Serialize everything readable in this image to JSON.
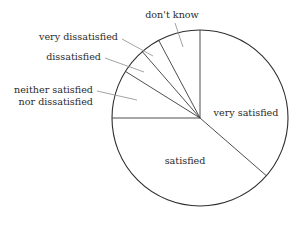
{
  "chart_data": {
    "type": "pie",
    "title": "",
    "subtitle": "",
    "xlabel": "",
    "ylabel": "",
    "legend_position": "none",
    "grid": false,
    "labels_placement": "callout-and-inside",
    "center": {
      "x": 200,
      "y": 118
    },
    "radius": 88,
    "start_angle_deg": 90,
    "direction": "clockwise",
    "categories": [
      "very satisfied",
      "satisfied",
      "neither satisfied nor dissatisfied",
      "dissatisfied",
      "very dissatisfied",
      "don't know"
    ],
    "values": [
      36,
      41,
      9,
      5,
      4,
      5
    ],
    "units": "percent",
    "slices": [
      {
        "label": "very satisfied",
        "value": 36,
        "start_deg": 90,
        "end_deg": -41,
        "sweep_deg": 131,
        "label_x": 246,
        "label_y": 113,
        "label_anchor": "middle",
        "callout": false
      },
      {
        "label": "satisfied",
        "value": 41,
        "start_deg": -41,
        "end_deg": -180,
        "sweep_deg": 139,
        "label_x": 185,
        "label_y": 161,
        "label_anchor": "middle",
        "callout": false
      },
      {
        "label": "neither satisfied",
        "label_line2": "nor dissatisfied",
        "value": 9,
        "start_deg": 180,
        "end_deg": 148,
        "sweep_deg": 32,
        "label_x": 93,
        "label_y": 90,
        "label_anchor": "end",
        "callout": true,
        "leader": {
          "x1": 97,
          "y1": 91,
          "x2": 137,
          "y2": 100
        }
      },
      {
        "label": "dissatisfied",
        "value": 5,
        "start_deg": 148,
        "end_deg": 131,
        "sweep_deg": 17,
        "label_x": 101,
        "label_y": 57,
        "label_anchor": "end",
        "callout": true,
        "leader": {
          "x1": 105,
          "y1": 58,
          "x2": 144,
          "y2": 72
        }
      },
      {
        "label": "very dissatisfied",
        "value": 4,
        "start_deg": 131,
        "end_deg": 118,
        "sweep_deg": 13,
        "label_x": 118,
        "label_y": 37,
        "label_anchor": "end",
        "callout": true,
        "leader": {
          "x1": 122,
          "y1": 39,
          "x2": 153,
          "y2": 56
        }
      },
      {
        "label": "don't know",
        "value": 5,
        "start_deg": 118,
        "end_deg": 90,
        "sweep_deg": 28,
        "label_x": 172,
        "label_y": 15,
        "label_anchor": "middle",
        "callout": true,
        "leader": {
          "x1": 175,
          "y1": 23,
          "x2": 183,
          "y2": 47
        }
      }
    ],
    "colors": {
      "background": "#ffffff",
      "outline": "#2e2e2e",
      "slice_edge": "#3a3a3a",
      "leader": "#8d8d8d",
      "text": "#2b2b2b"
    }
  }
}
